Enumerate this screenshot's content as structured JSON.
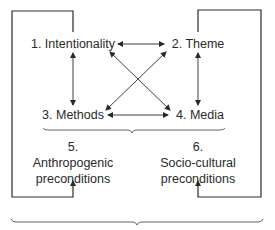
{
  "nodes": {
    "n1": "1. Intentionality",
    "n2": "2. Theme",
    "n3": "3. Methods",
    "n4": "4. Media",
    "n5_num": "5.",
    "n5_line1": "Anthropogenic",
    "n5_line2": "preconditions",
    "n6_num": "6.",
    "n6_line1": "Socio-cultural",
    "n6_line2": "preconditions"
  },
  "colors": {
    "line": "#2a2a2a",
    "text": "#2a2a2a",
    "background": "#ffffff"
  }
}
